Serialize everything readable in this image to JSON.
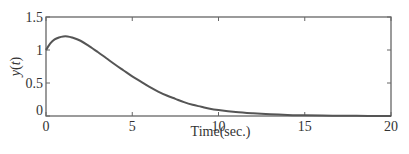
{
  "chart_data": {
    "type": "line",
    "title": "",
    "xlabel": "Time(sec.)",
    "ylabel_parts": [
      "y",
      "(",
      "t",
      ")"
    ],
    "ylabel": "y(t)",
    "xlim": [
      0,
      20
    ],
    "ylim": [
      0,
      1.5
    ],
    "x_ticks": [
      0,
      5,
      10,
      15,
      20
    ],
    "x_tick_labels": [
      "0",
      "5",
      "10",
      "15",
      "20"
    ],
    "y_ticks": [
      0,
      0.5,
      1,
      1.5
    ],
    "y_tick_labels": [
      "0",
      "0.5",
      "1",
      "1.5"
    ],
    "grid": false,
    "legend": null,
    "series": [
      {
        "name": "y(t)",
        "color": "#555555",
        "x": [
          0,
          0.25,
          0.5,
          0.75,
          1,
          1.25,
          1.5,
          2,
          2.5,
          3,
          3.5,
          4,
          4.5,
          5,
          5.5,
          6,
          6.5,
          7,
          7.5,
          8,
          8.5,
          9,
          9.5,
          10,
          11,
          12,
          13,
          14,
          15,
          16,
          17,
          18,
          19,
          20
        ],
        "y": [
          1.0,
          1.1,
          1.16,
          1.19,
          1.205,
          1.205,
          1.19,
          1.14,
          1.06,
          0.97,
          0.875,
          0.78,
          0.69,
          0.6,
          0.52,
          0.44,
          0.37,
          0.31,
          0.26,
          0.21,
          0.17,
          0.14,
          0.11,
          0.09,
          0.06,
          0.04,
          0.025,
          0.015,
          0.01,
          0.006,
          0.004,
          0.002,
          0.001,
          0.0
        ]
      }
    ]
  },
  "colors": {
    "axis": "#666666",
    "line": "#555555",
    "background": "#ffffff"
  }
}
